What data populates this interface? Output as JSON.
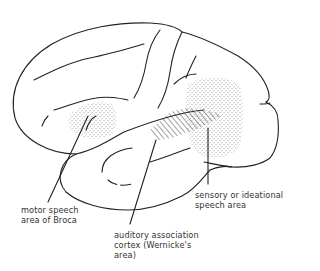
{
  "figure": {
    "type": "brain lateral view line drawing",
    "colors": {
      "line": "#222222",
      "stipple": "#555555",
      "text": "#333333",
      "background": "#ffffff"
    }
  },
  "labels": {
    "broca": {
      "lines": [
        "motor speech",
        "area of Broca"
      ]
    },
    "wernicke": {
      "lines": [
        "auditory association",
        "cortex (Wernicke's",
        "area)"
      ]
    },
    "sensory": {
      "lines": [
        "sensory or ideational",
        "speech area"
      ]
    }
  }
}
